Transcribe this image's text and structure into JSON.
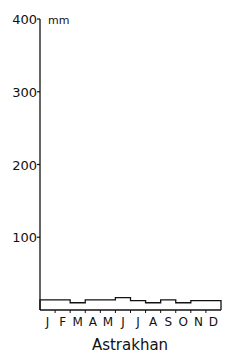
{
  "chart_data": {
    "type": "line",
    "style": "step",
    "title": "Astrakhan",
    "xlabel": "",
    "ylabel": "mm",
    "ylim": [
      0,
      400
    ],
    "yticks": [
      100,
      200,
      300,
      400
    ],
    "ytick_labels": [
      "100",
      "200",
      "300",
      "400"
    ],
    "categories": [
      "J",
      "F",
      "M",
      "A",
      "M",
      "J",
      "J",
      "A",
      "S",
      "O",
      "N",
      "D"
    ],
    "series": [
      {
        "name": "Precipitation",
        "values": [
          14,
          14,
          10,
          14,
          14,
          17,
          13,
          10,
          14,
          10,
          13,
          13
        ]
      }
    ],
    "grid": false,
    "legend": null
  },
  "labels": {
    "unit": "mm",
    "station": "Astrakhan"
  }
}
